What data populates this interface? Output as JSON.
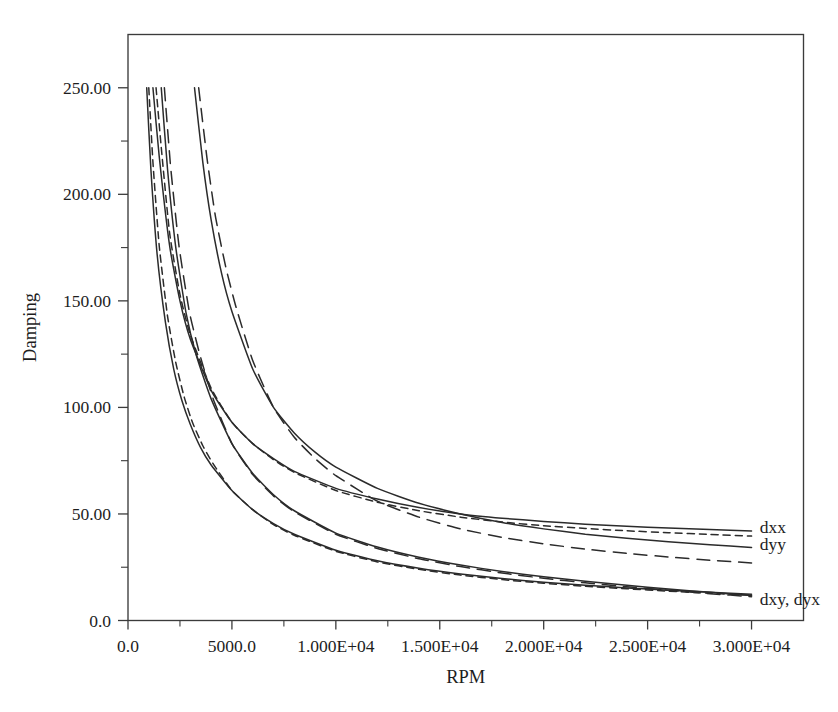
{
  "figure": {
    "ghost_top_text": "",
    "background": "#ffffff",
    "ink_color": "#2b2b2b"
  },
  "chart_data": {
    "type": "line",
    "title": "",
    "xlabel": "RPM",
    "ylabel": "Damping",
    "xlim": [
      0,
      32500
    ],
    "ylim": [
      0,
      275
    ],
    "grid": false,
    "legend_position": "right-inline",
    "x_tick_values": [
      0,
      5000,
      10000,
      15000,
      20000,
      25000,
      30000
    ],
    "x_tick_labels": [
      "0.0",
      "5000.0",
      "1.000E+04",
      "1.500E+04",
      "2.000E+04",
      "2.500E+04",
      "3.000E+04"
    ],
    "x_minor_ticks": [
      2500,
      7500,
      12500,
      17500,
      22500,
      27500
    ],
    "y_tick_values": [
      0,
      50,
      100,
      150,
      200,
      250
    ],
    "y_tick_labels": [
      "0.0",
      "50.00",
      "100.00",
      "150.00",
      "200.00",
      "250.00"
    ],
    "y_minor_ticks": [
      25,
      75,
      125,
      175,
      225
    ],
    "annotations": [
      {
        "text": "dxx",
        "x": 30400,
        "y": 44
      },
      {
        "text": "dyy",
        "x": 30400,
        "y": 36
      },
      {
        "text": "dxy, dyx",
        "x": 30400,
        "y": 10
      }
    ],
    "series": [
      {
        "name": "dxx",
        "style": "solid",
        "x": [
          1200,
          1500,
          2000,
          2500,
          3000,
          4000,
          5000,
          6000,
          7000,
          8000,
          10000,
          12000,
          14000,
          16000,
          18000,
          20000,
          22000,
          24000,
          26000,
          28000,
          30000
        ],
        "values": [
          250,
          218,
          176,
          150,
          132,
          108,
          93,
          83,
          76,
          70,
          62,
          57,
          53,
          50,
          48,
          46.5,
          45.2,
          44.2,
          43.4,
          42.7,
          42.0
        ]
      },
      {
        "name": "dxx-pair",
        "style": "dashed",
        "x": [
          1350,
          1600,
          2000,
          2500,
          3000,
          4000,
          5000,
          6000,
          7000,
          8000,
          10000,
          12000,
          14000,
          16000,
          18000,
          20000,
          22000,
          24000,
          26000,
          28000,
          30000
        ],
        "values": [
          250,
          222,
          182,
          153,
          134,
          109,
          93,
          83,
          75.5,
          69.5,
          61,
          55.5,
          51.5,
          48.5,
          46.2,
          44.5,
          43.2,
          42.1,
          41.2,
          40.4,
          39.6
        ]
      },
      {
        "name": "dyy",
        "style": "solid",
        "x": [
          3200,
          3600,
          4000,
          4500,
          5000,
          6000,
          7000,
          8000,
          9000,
          10000,
          12000,
          14000,
          16000,
          18000,
          20000,
          22000,
          24000,
          26000,
          28000,
          30000
        ],
        "values": [
          250,
          215,
          188,
          163,
          145,
          118,
          100,
          88,
          79,
          72,
          62,
          55,
          50,
          46,
          43,
          40.5,
          38.6,
          37.0,
          35.6,
          34.3
        ]
      },
      {
        "name": "dyy-pair",
        "style": "longdash",
        "x": [
          3400,
          3800,
          4200,
          4700,
          5200,
          6000,
          7000,
          8000,
          9000,
          10000,
          12000,
          14000,
          16000,
          18000,
          20000,
          22000,
          24000,
          26000,
          28000,
          30000
        ],
        "values": [
          250,
          217,
          190,
          166,
          147,
          122,
          100,
          86,
          76,
          68,
          56,
          48.5,
          43,
          39,
          36,
          33.5,
          31.5,
          29.8,
          28.3,
          27.0
        ]
      },
      {
        "name": "dxy",
        "style": "solid",
        "x": [
          900,
          1100,
          1400,
          1800,
          2200,
          2600,
          3000,
          3500,
          4000,
          5000,
          6000,
          7000,
          8000,
          10000,
          12000,
          14000,
          16000,
          18000,
          20000,
          22000,
          24000,
          26000,
          28000,
          30000
        ],
        "values": [
          250,
          212,
          172,
          140,
          118,
          103,
          92,
          81,
          73,
          61,
          52,
          45.5,
          40.5,
          33,
          28,
          24.5,
          21.8,
          19.7,
          18.0,
          16.6,
          15.3,
          14.2,
          13.2,
          12.3
        ]
      },
      {
        "name": "dyx",
        "style": "dashed",
        "x": [
          1000,
          1200,
          1500,
          1900,
          2300,
          2700,
          3100,
          3600,
          4100,
          5000,
          6000,
          7000,
          8000,
          10000,
          12000,
          14000,
          16000,
          18000,
          20000,
          22000,
          24000,
          26000,
          28000,
          30000
        ],
        "values": [
          250,
          215,
          176,
          143,
          121,
          105,
          93,
          82,
          73.5,
          61,
          52,
          45,
          40,
          32.5,
          27.5,
          24,
          21.3,
          19.2,
          17.5,
          16.1,
          14.9,
          13.8,
          12.8,
          11.9
        ]
      },
      {
        "name": "lower-solid",
        "style": "solid",
        "x": [
          1600,
          1900,
          2300,
          2800,
          3300,
          4000,
          5000,
          6000,
          7000,
          8000,
          10000,
          12000,
          14000,
          16000,
          18000,
          20000,
          22000,
          24000,
          26000,
          28000,
          30000
        ],
        "values": [
          250,
          212,
          175,
          144,
          124,
          104,
          83,
          69,
          59,
          51.5,
          41,
          34.5,
          29.7,
          26,
          23,
          20.5,
          18.4,
          16.5,
          14.8,
          13.2,
          11.7
        ]
      },
      {
        "name": "lower-dash",
        "style": "longdash",
        "x": [
          1750,
          2050,
          2450,
          2950,
          3450,
          4100,
          5000,
          6000,
          7000,
          8000,
          10000,
          12000,
          14000,
          16000,
          18000,
          20000,
          22000,
          24000,
          26000,
          28000,
          30000
        ],
        "values": [
          250,
          213,
          176,
          145,
          125,
          104,
          83,
          68.5,
          58.5,
          51,
          40.5,
          33.8,
          29,
          25.3,
          22.3,
          19.8,
          17.7,
          15.8,
          14.2,
          12.6,
          11.2
        ]
      }
    ]
  }
}
